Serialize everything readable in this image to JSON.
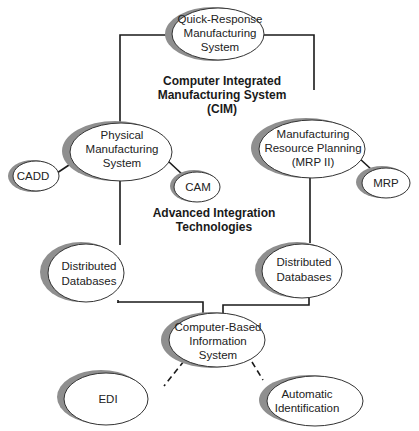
{
  "diagram": {
    "nodes": {
      "qrms": {
        "lines": [
          "Quick-Response",
          "Manufacturing",
          "System"
        ]
      },
      "pms": {
        "lines": [
          "Physical",
          "Manufacturing",
          "System"
        ]
      },
      "mrp2": {
        "lines": [
          "Manufacturing",
          "Resource Planning",
          "(MRP II)"
        ]
      },
      "cadd": {
        "lines": [
          "CADD"
        ]
      },
      "cam": {
        "lines": [
          "CAM"
        ]
      },
      "mrp": {
        "lines": [
          "MRP"
        ]
      },
      "ddb_left": {
        "lines": [
          "Distributed",
          "Databases"
        ]
      },
      "ddb_right": {
        "lines": [
          "Distributed",
          "Databases"
        ]
      },
      "cbis": {
        "lines": [
          "Computer-Based",
          "Information",
          "System"
        ]
      },
      "edi": {
        "lines": [
          "EDI"
        ]
      },
      "autoid": {
        "lines": [
          "Automatic",
          "Identification"
        ]
      }
    },
    "labels": {
      "cim": [
        "Computer Integrated",
        "Manufacturing System",
        "(CIM)"
      ],
      "ait": [
        "Advanced Integration",
        "Technologies"
      ]
    },
    "colors": {
      "line": "#1a1a1a",
      "shadow": "#8f8f8f",
      "fill": "#ffffff"
    }
  }
}
